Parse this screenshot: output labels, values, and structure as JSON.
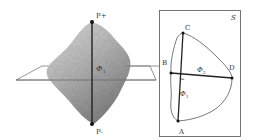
{
  "figure": {
    "left_panel": {
      "description": "Irregular particle (rock) with vertical principal axis through a horizontal cutting plane",
      "axis_top_label": "P+",
      "axis_bottom_label": "P-",
      "axis_angle_label": "Φ",
      "axis_angle_subscript": "1"
    },
    "right_panel": {
      "panel_label": "S",
      "points": {
        "A": "A",
        "B": "B",
        "C": "C",
        "D": "D"
      },
      "phi1_label": "Φ",
      "phi1_sub": "1",
      "phi2_label": "Φ",
      "phi2_sub": "2"
    },
    "colors": {
      "line": "#222222",
      "rock_light": "#d8d8d8",
      "rock_dark": "#8a8a8a",
      "plane": "#777777",
      "box": "#666666"
    }
  }
}
